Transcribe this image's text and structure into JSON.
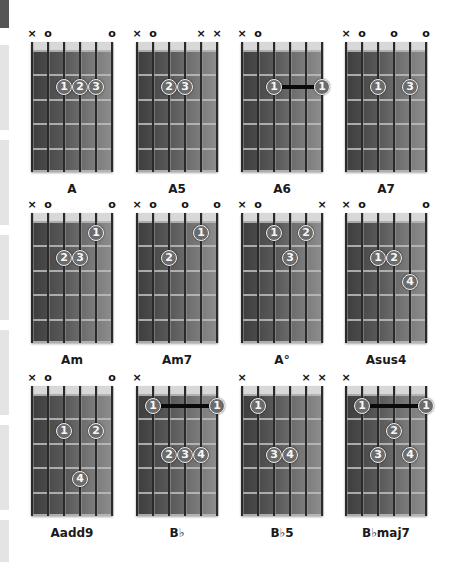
{
  "page": {
    "side_tabs": [
      {
        "top": 0,
        "height": 28,
        "style": "dark"
      },
      {
        "top": 45,
        "height": 85,
        "style": "light"
      },
      {
        "top": 140,
        "height": 85,
        "style": "light"
      },
      {
        "top": 235,
        "height": 85,
        "style": "light"
      },
      {
        "top": 330,
        "height": 85,
        "style": "light"
      },
      {
        "top": 425,
        "height": 85,
        "style": "light"
      },
      {
        "top": 520,
        "height": 42,
        "style": "light"
      }
    ]
  },
  "chord_grid": {
    "frets_shown": 5,
    "strings": 6,
    "chords": [
      {
        "name": "A",
        "x": 25,
        "y": 26,
        "markers": [
          "x",
          "o",
          "",
          "",
          "",
          "o"
        ],
        "fingers": [
          {
            "f": "1",
            "s": 3,
            "fret": 2
          },
          {
            "f": "2",
            "s": 4,
            "fret": 2
          },
          {
            "f": "3",
            "s": 5,
            "fret": 2
          }
        ],
        "barre": null
      },
      {
        "name": "A5",
        "x": 130,
        "y": 26,
        "markers": [
          "x",
          "o",
          "",
          "",
          "x",
          "x"
        ],
        "fingers": [
          {
            "f": "2",
            "s": 3,
            "fret": 2
          },
          {
            "f": "3",
            "s": 4,
            "fret": 2
          }
        ],
        "barre": null
      },
      {
        "name": "A6",
        "x": 235,
        "y": 26,
        "markers": [
          "x",
          "o",
          "",
          "",
          "",
          ""
        ],
        "fingers": [
          {
            "f": "1",
            "s": 3,
            "fret": 2
          },
          {
            "f": "1",
            "s": 6,
            "fret": 2
          }
        ],
        "barre": {
          "from": 3,
          "to": 6,
          "fret": 2
        }
      },
      {
        "name": "A7",
        "x": 339,
        "y": 26,
        "markers": [
          "x",
          "o",
          "",
          "o",
          "",
          "o"
        ],
        "fingers": [
          {
            "f": "1",
            "s": 3,
            "fret": 2
          },
          {
            "f": "3",
            "s": 5,
            "fret": 2
          }
        ],
        "barre": null
      },
      {
        "name": "Am",
        "x": 25,
        "y": 197,
        "markers": [
          "x",
          "o",
          "",
          "",
          "",
          "o"
        ],
        "fingers": [
          {
            "f": "1",
            "s": 5,
            "fret": 1
          },
          {
            "f": "2",
            "s": 3,
            "fret": 2
          },
          {
            "f": "3",
            "s": 4,
            "fret": 2
          }
        ],
        "barre": null
      },
      {
        "name": "Am7",
        "x": 130,
        "y": 197,
        "markers": [
          "x",
          "o",
          "",
          "o",
          "",
          "o"
        ],
        "fingers": [
          {
            "f": "1",
            "s": 5,
            "fret": 1
          },
          {
            "f": "2",
            "s": 3,
            "fret": 2
          }
        ],
        "barre": null
      },
      {
        "name": "A°",
        "x": 235,
        "y": 197,
        "markers": [
          "x",
          "o",
          "",
          "",
          "",
          "x"
        ],
        "fingers": [
          {
            "f": "1",
            "s": 3,
            "fret": 1
          },
          {
            "f": "2",
            "s": 5,
            "fret": 1
          },
          {
            "f": "3",
            "s": 4,
            "fret": 2
          }
        ],
        "barre": null
      },
      {
        "name": "Asus4",
        "x": 339,
        "y": 197,
        "markers": [
          "x",
          "o",
          "",
          "",
          "",
          "o"
        ],
        "fingers": [
          {
            "f": "1",
            "s": 3,
            "fret": 2
          },
          {
            "f": "2",
            "s": 4,
            "fret": 2
          },
          {
            "f": "4",
            "s": 5,
            "fret": 3
          }
        ],
        "barre": null
      },
      {
        "name": "Aadd9",
        "x": 25,
        "y": 370,
        "markers": [
          "x",
          "o",
          "",
          "",
          "",
          "o"
        ],
        "fingers": [
          {
            "f": "1",
            "s": 3,
            "fret": 2
          },
          {
            "f": "2",
            "s": 5,
            "fret": 2
          },
          {
            "f": "4",
            "s": 4,
            "fret": 4
          }
        ],
        "barre": null
      },
      {
        "name": "B♭",
        "x": 130,
        "y": 370,
        "markers": [
          "x",
          "",
          "",
          "",
          "",
          ""
        ],
        "fingers": [
          {
            "f": "1",
            "s": 2,
            "fret": 1
          },
          {
            "f": "1",
            "s": 6,
            "fret": 1
          },
          {
            "f": "2",
            "s": 3,
            "fret": 3
          },
          {
            "f": "3",
            "s": 4,
            "fret": 3
          },
          {
            "f": "4",
            "s": 5,
            "fret": 3
          }
        ],
        "barre": {
          "from": 2,
          "to": 6,
          "fret": 1
        }
      },
      {
        "name": "B♭5",
        "x": 235,
        "y": 370,
        "markers": [
          "x",
          "",
          "",
          "",
          "x",
          "x"
        ],
        "fingers": [
          {
            "f": "1",
            "s": 2,
            "fret": 1
          },
          {
            "f": "3",
            "s": 3,
            "fret": 3
          },
          {
            "f": "4",
            "s": 4,
            "fret": 3
          }
        ],
        "barre": null
      },
      {
        "name": "B♭maj7",
        "x": 339,
        "y": 370,
        "markers": [
          "x",
          "",
          "",
          "",
          "",
          ""
        ],
        "fingers": [
          {
            "f": "1",
            "s": 2,
            "fret": 1
          },
          {
            "f": "1",
            "s": 6,
            "fret": 1
          },
          {
            "f": "2",
            "s": 4,
            "fret": 2
          },
          {
            "f": "3",
            "s": 3,
            "fret": 3
          },
          {
            "f": "4",
            "s": 5,
            "fret": 3
          }
        ],
        "barre": {
          "from": 2,
          "to": 6,
          "fret": 1
        }
      }
    ]
  },
  "marker_glyphs": {
    "x": "×",
    "o": "o"
  }
}
